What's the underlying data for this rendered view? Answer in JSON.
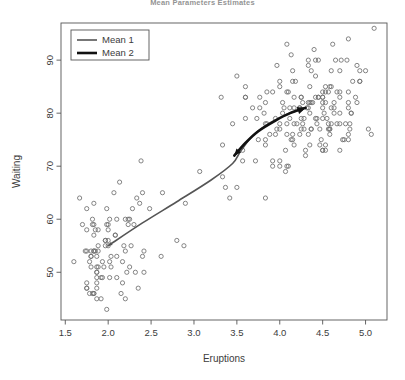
{
  "chart_data": {
    "type": "scatter",
    "title": "Mean Parameters Estimates",
    "xlabel": "Eruptions",
    "ylabel": "Waiting",
    "xlim": [
      1.45,
      5.25
    ],
    "ylim": [
      41,
      97
    ],
    "xticks": [
      1.5,
      2.0,
      2.5,
      3.0,
      3.5,
      4.0,
      4.5,
      5.0
    ],
    "xticklabels": [
      "1.5",
      "2.0",
      "2.5",
      "3.0",
      "3.5",
      "4.0",
      "4.5",
      "5.0"
    ],
    "yticks": [
      50,
      60,
      70,
      80,
      90
    ],
    "yticklabels": [
      "50",
      "60",
      "70",
      "80",
      "90"
    ],
    "grid": false,
    "legend": {
      "position": "top-left",
      "entries": [
        {
          "label": "Mean 1",
          "color": "#555555",
          "width": 1.6
        },
        {
          "label": "Mean 2",
          "color": "#111111",
          "width": 2.6
        }
      ]
    },
    "marker": {
      "shape": "open-circle",
      "size": 4.2,
      "color": "#6f6f6f"
    },
    "points": [
      [
        3.6,
        79
      ],
      [
        1.8,
        54
      ],
      [
        3.333,
        74
      ],
      [
        2.283,
        62
      ],
      [
        4.533,
        85
      ],
      [
        2.883,
        55
      ],
      [
        4.7,
        88
      ],
      [
        3.6,
        85
      ],
      [
        1.95,
        51
      ],
      [
        4.35,
        85
      ],
      [
        1.833,
        54
      ],
      [
        3.917,
        84
      ],
      [
        4.2,
        78
      ],
      [
        1.75,
        47
      ],
      [
        4.7,
        83
      ],
      [
        2.167,
        52
      ],
      [
        1.75,
        62
      ],
      [
        4.8,
        84
      ],
      [
        1.6,
        52
      ],
      [
        4.25,
        79
      ],
      [
        1.8,
        51
      ],
      [
        1.75,
        47
      ],
      [
        3.45,
        78
      ],
      [
        3.067,
        69
      ],
      [
        4.533,
        74
      ],
      [
        3.6,
        83
      ],
      [
        1.967,
        55
      ],
      [
        4.083,
        76
      ],
      [
        3.85,
        78
      ],
      [
        4.433,
        79
      ],
      [
        4.3,
        73
      ],
      [
        4.467,
        77
      ],
      [
        3.367,
        66
      ],
      [
        4.033,
        80
      ],
      [
        3.833,
        74
      ],
      [
        2.017,
        52
      ],
      [
        1.867,
        48
      ],
      [
        4.833,
        80
      ],
      [
        1.833,
        59
      ],
      [
        4.783,
        90
      ],
      [
        4.35,
        80
      ],
      [
        1.883,
        58
      ],
      [
        4.567,
        84
      ],
      [
        1.75,
        58
      ],
      [
        4.533,
        73
      ],
      [
        3.317,
        83
      ],
      [
        3.833,
        64
      ],
      [
        2.1,
        53
      ],
      [
        4.633,
        82
      ],
      [
        2.0,
        59
      ],
      [
        4.8,
        75
      ],
      [
        4.716,
        90
      ],
      [
        1.833,
        54
      ],
      [
        4.833,
        80
      ],
      [
        1.733,
        54
      ],
      [
        4.883,
        83
      ],
      [
        3.717,
        71
      ],
      [
        1.667,
        64
      ],
      [
        4.567,
        77
      ],
      [
        4.317,
        81
      ],
      [
        2.233,
        59
      ],
      [
        4.5,
        84
      ],
      [
        1.75,
        48
      ],
      [
        4.8,
        82
      ],
      [
        1.817,
        60
      ],
      [
        4.4,
        92
      ],
      [
        4.167,
        78
      ],
      [
        4.7,
        78
      ],
      [
        2.067,
        65
      ],
      [
        4.7,
        73
      ],
      [
        4.033,
        82
      ],
      [
        1.967,
        56
      ],
      [
        4.5,
        79
      ],
      [
        4.0,
        71
      ],
      [
        1.983,
        62
      ],
      [
        5.067,
        76
      ],
      [
        2.017,
        60
      ],
      [
        4.567,
        78
      ],
      [
        3.883,
        76
      ],
      [
        3.6,
        83
      ],
      [
        4.133,
        75
      ],
      [
        4.333,
        82
      ],
      [
        4.1,
        70
      ],
      [
        2.633,
        65
      ],
      [
        4.067,
        73
      ],
      [
        4.933,
        88
      ],
      [
        3.95,
        76
      ],
      [
        4.517,
        80
      ],
      [
        2.167,
        48
      ],
      [
        4.0,
        86
      ],
      [
        2.2,
        60
      ],
      [
        4.333,
        90
      ],
      [
        1.867,
        50
      ],
      [
        4.817,
        78
      ],
      [
        1.833,
        63
      ],
      [
        4.3,
        72
      ],
      [
        4.667,
        84
      ],
      [
        3.75,
        75
      ],
      [
        1.867,
        51
      ],
      [
        4.9,
        82
      ],
      [
        2.483,
        62
      ],
      [
        4.367,
        88
      ],
      [
        2.1,
        49
      ],
      [
        4.5,
        83
      ],
      [
        4.05,
        81
      ],
      [
        1.867,
        47
      ],
      [
        4.7,
        84
      ],
      [
        1.783,
        52
      ],
      [
        4.85,
        86
      ],
      [
        3.683,
        81
      ],
      [
        4.733,
        75
      ],
      [
        2.3,
        59
      ],
      [
        4.9,
        89
      ],
      [
        4.417,
        79
      ],
      [
        1.7,
        59
      ],
      [
        4.633,
        81
      ],
      [
        2.317,
        50
      ],
      [
        4.6,
        85
      ],
      [
        1.817,
        59
      ],
      [
        4.417,
        87
      ],
      [
        2.617,
        53
      ],
      [
        4.067,
        69
      ],
      [
        4.25,
        77
      ],
      [
        1.967,
        56
      ],
      [
        4.6,
        88
      ],
      [
        3.767,
        81
      ],
      [
        1.917,
        45
      ],
      [
        4.5,
        82
      ],
      [
        2.267,
        55
      ],
      [
        4.65,
        90
      ],
      [
        1.867,
        45
      ],
      [
        4.167,
        83
      ],
      [
        2.8,
        56
      ],
      [
        4.333,
        89
      ],
      [
        1.833,
        46
      ],
      [
        4.383,
        82
      ],
      [
        1.883,
        51
      ],
      [
        4.933,
        86
      ],
      [
        2.033,
        53
      ],
      [
        3.733,
        79
      ],
      [
        4.233,
        81
      ],
      [
        2.233,
        60
      ],
      [
        4.533,
        82
      ],
      [
        4.817,
        77
      ],
      [
        4.333,
        76
      ],
      [
        1.983,
        59
      ],
      [
        4.633,
        80
      ],
      [
        2.017,
        49
      ],
      [
        5.1,
        96
      ],
      [
        1.8,
        53
      ],
      [
        5.033,
        77
      ],
      [
        4.0,
        77
      ],
      [
        2.4,
        65
      ],
      [
        4.6,
        81
      ],
      [
        3.567,
        71
      ],
      [
        4.0,
        70
      ],
      [
        4.5,
        81
      ],
      [
        4.083,
        93
      ],
      [
        1.8,
        53
      ],
      [
        3.967,
        89
      ],
      [
        2.2,
        45
      ],
      [
        4.15,
        86
      ],
      [
        2.0,
        58
      ],
      [
        3.833,
        78
      ],
      [
        3.5,
        66
      ],
      [
        4.583,
        76
      ],
      [
        2.367,
        63
      ],
      [
        5.0,
        88
      ],
      [
        1.933,
        52
      ],
      [
        4.617,
        93
      ],
      [
        1.917,
        49
      ],
      [
        2.083,
        57
      ],
      [
        4.583,
        77
      ],
      [
        3.333,
        68
      ],
      [
        4.167,
        81
      ],
      [
        4.333,
        81
      ],
      [
        4.5,
        73
      ],
      [
        2.417,
        50
      ],
      [
        4.0,
        85
      ],
      [
        4.167,
        74
      ],
      [
        1.883,
        55
      ],
      [
        4.583,
        77
      ],
      [
        4.25,
        83
      ],
      [
        3.767,
        83
      ],
      [
        2.033,
        51
      ],
      [
        4.433,
        78
      ],
      [
        4.083,
        84
      ],
      [
        1.833,
        46
      ],
      [
        4.417,
        83
      ],
      [
        2.183,
        55
      ],
      [
        4.8,
        81
      ],
      [
        1.833,
        57
      ],
      [
        4.8,
        76
      ],
      [
        4.1,
        84
      ],
      [
        3.966,
        77
      ],
      [
        4.233,
        81
      ],
      [
        3.5,
        87
      ],
      [
        4.366,
        77
      ],
      [
        2.25,
        51
      ],
      [
        4.667,
        78
      ],
      [
        2.1,
        60
      ],
      [
        4.35,
        82
      ],
      [
        4.133,
        91
      ],
      [
        1.867,
        53
      ],
      [
        4.6,
        78
      ],
      [
        1.783,
        46
      ],
      [
        4.367,
        77
      ],
      [
        3.85,
        84
      ],
      [
        1.933,
        49
      ],
      [
        4.5,
        83
      ],
      [
        2.383,
        71
      ],
      [
        4.7,
        80
      ],
      [
        1.867,
        49
      ],
      [
        3.833,
        75
      ],
      [
        3.417,
        64
      ],
      [
        4.233,
        76
      ],
      [
        2.4,
        53
      ],
      [
        4.8,
        94
      ],
      [
        2.0,
        55
      ],
      [
        4.15,
        76
      ],
      [
        1.867,
        50
      ],
      [
        4.267,
        82
      ],
      [
        1.75,
        54
      ],
      [
        4.483,
        75
      ],
      [
        4.0,
        78
      ],
      [
        4.117,
        79
      ],
      [
        4.083,
        78
      ],
      [
        4.267,
        78
      ],
      [
        3.917,
        70
      ],
      [
        4.55,
        79
      ],
      [
        4.083,
        70
      ],
      [
        2.417,
        54
      ],
      [
        4.183,
        86
      ],
      [
        2.217,
        50
      ],
      [
        4.45,
        90
      ],
      [
        1.883,
        54
      ],
      [
        1.85,
        54
      ],
      [
        4.283,
        77
      ],
      [
        3.95,
        79
      ],
      [
        2.333,
        64
      ],
      [
        4.15,
        75
      ],
      [
        2.35,
        47
      ],
      [
        4.933,
        86
      ],
      [
        2.9,
        63
      ],
      [
        4.583,
        85
      ],
      [
        3.833,
        82
      ],
      [
        2.083,
        57
      ],
      [
        4.367,
        82
      ],
      [
        2.133,
        67
      ],
      [
        4.35,
        74
      ],
      [
        2.2,
        54
      ],
      [
        4.45,
        83
      ],
      [
        3.567,
        73
      ],
      [
        4.5,
        73
      ],
      [
        4.15,
        88
      ],
      [
        3.817,
        80
      ],
      [
        3.917,
        71
      ],
      [
        4.45,
        83
      ],
      [
        2.0,
        56
      ],
      [
        4.283,
        79
      ],
      [
        4.767,
        78
      ],
      [
        4.533,
        84
      ],
      [
        1.85,
        58
      ],
      [
        4.25,
        83
      ],
      [
        1.983,
        43
      ],
      [
        2.25,
        60
      ],
      [
        4.75,
        75
      ],
      [
        4.117,
        81
      ],
      [
        2.15,
        46
      ],
      [
        4.417,
        90
      ],
      [
        1.817,
        46
      ],
      [
        4.467,
        74
      ]
    ],
    "lines": [
      {
        "name": "Mean 1",
        "color": "#555555",
        "width": 1.6,
        "arrow": true,
        "points": [
          [
            2.0,
            55.0
          ],
          [
            2.4,
            59.3
          ],
          [
            2.8,
            63.3
          ],
          [
            3.2,
            67.4
          ],
          [
            3.45,
            70.5
          ],
          [
            3.55,
            73.0
          ],
          [
            3.7,
            76.0
          ],
          [
            3.9,
            78.3
          ],
          [
            4.1,
            79.9
          ],
          [
            4.3,
            81.0
          ]
        ]
      },
      {
        "name": "Mean 2",
        "color": "#111111",
        "width": 2.6,
        "arrow": true,
        "points": [
          [
            3.47,
            72.0
          ],
          [
            3.6,
            74.4
          ],
          [
            3.75,
            76.6
          ],
          [
            3.95,
            78.6
          ],
          [
            4.12,
            80.0
          ],
          [
            4.3,
            81.0
          ]
        ]
      }
    ]
  }
}
